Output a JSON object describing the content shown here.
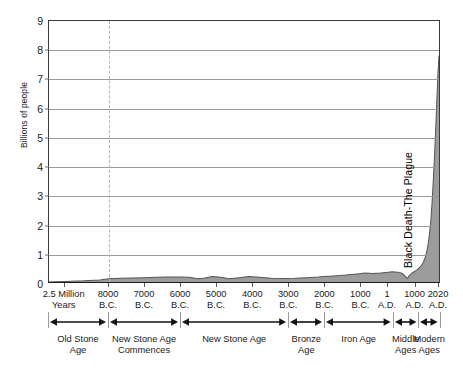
{
  "chart_data": {
    "type": "area",
    "title": "",
    "xlabel": "",
    "ylabel": "Billions of people",
    "ylim": [
      0,
      9
    ],
    "yticks": [
      0,
      1,
      2,
      3,
      4,
      5,
      6,
      7,
      8,
      9
    ],
    "ytick_labels": [
      "0",
      "1",
      "2",
      "3",
      "4",
      "5",
      "6",
      "7",
      "8",
      "9"
    ],
    "grid": true,
    "legend": "none",
    "xtick_labels": [
      "2.5 Million Years",
      "8000 B.C.",
      "7000 B.C.",
      "6000 B.C.",
      "5000 B.C.",
      "4000 B.C.",
      "3000 B.C.",
      "2000 B.C.",
      "1000 B.C.",
      "1 A.D.",
      "1000 A.D.",
      "2020 A.D."
    ],
    "xticks": [
      {
        "line1": "2.5 Million",
        "line2": "Years",
        "pos": 0.04
      },
      {
        "line1": "8000",
        "line2": "B.C.",
        "pos": 0.153
      },
      {
        "line1": "7000",
        "line2": "B.C.",
        "pos": 0.245
      },
      {
        "line1": "6000",
        "line2": "B.C.",
        "pos": 0.337
      },
      {
        "line1": "5000",
        "line2": "B.C.",
        "pos": 0.429
      },
      {
        "line1": "4000",
        "line2": "B.C.",
        "pos": 0.521
      },
      {
        "line1": "3000",
        "line2": "B.C.",
        "pos": 0.613
      },
      {
        "line1": "2000",
        "line2": "B.C.",
        "pos": 0.705
      },
      {
        "line1": "1000",
        "line2": "B.C.",
        "pos": 0.797
      },
      {
        "line1": "1",
        "line2": "A.D.",
        "pos": 0.865
      },
      {
        "line1": "1000",
        "line2": "A.D.",
        "pos": 0.935
      },
      {
        "line1": "2020",
        "line2": "A.D.",
        "pos": 0.995
      }
    ],
    "series": [
      {
        "name": "World population",
        "fill_color": "#9c9c9c",
        "line_color": "#555555",
        "points": [
          {
            "x": 0.0,
            "y": 0.0
          },
          {
            "x": 0.04,
            "y": 0.02
          },
          {
            "x": 0.09,
            "y": 0.04
          },
          {
            "x": 0.13,
            "y": 0.07
          },
          {
            "x": 0.153,
            "y": 0.11
          },
          {
            "x": 0.185,
            "y": 0.13
          },
          {
            "x": 0.215,
            "y": 0.14
          },
          {
            "x": 0.245,
            "y": 0.15
          },
          {
            "x": 0.275,
            "y": 0.16
          },
          {
            "x": 0.305,
            "y": 0.17
          },
          {
            "x": 0.337,
            "y": 0.17
          },
          {
            "x": 0.36,
            "y": 0.16
          },
          {
            "x": 0.382,
            "y": 0.11
          },
          {
            "x": 0.4,
            "y": 0.14
          },
          {
            "x": 0.418,
            "y": 0.19
          },
          {
            "x": 0.44,
            "y": 0.16
          },
          {
            "x": 0.462,
            "y": 0.11
          },
          {
            "x": 0.488,
            "y": 0.15
          },
          {
            "x": 0.512,
            "y": 0.19
          },
          {
            "x": 0.54,
            "y": 0.16
          },
          {
            "x": 0.57,
            "y": 0.13
          },
          {
            "x": 0.6,
            "y": 0.12
          },
          {
            "x": 0.63,
            "y": 0.13
          },
          {
            "x": 0.66,
            "y": 0.15
          },
          {
            "x": 0.69,
            "y": 0.17
          },
          {
            "x": 0.705,
            "y": 0.19
          },
          {
            "x": 0.73,
            "y": 0.21
          },
          {
            "x": 0.76,
            "y": 0.24
          },
          {
            "x": 0.79,
            "y": 0.28
          },
          {
            "x": 0.81,
            "y": 0.31
          },
          {
            "x": 0.83,
            "y": 0.29
          },
          {
            "x": 0.85,
            "y": 0.31
          },
          {
            "x": 0.865,
            "y": 0.33
          },
          {
            "x": 0.88,
            "y": 0.35
          },
          {
            "x": 0.895,
            "y": 0.34
          },
          {
            "x": 0.905,
            "y": 0.3
          },
          {
            "x": 0.912,
            "y": 0.22
          },
          {
            "x": 0.918,
            "y": 0.12
          },
          {
            "x": 0.924,
            "y": 0.22
          },
          {
            "x": 0.932,
            "y": 0.32
          },
          {
            "x": 0.942,
            "y": 0.4
          },
          {
            "x": 0.952,
            "y": 0.52
          },
          {
            "x": 0.96,
            "y": 0.68
          },
          {
            "x": 0.966,
            "y": 0.9
          },
          {
            "x": 0.971,
            "y": 1.2
          },
          {
            "x": 0.975,
            "y": 1.6
          },
          {
            "x": 0.979,
            "y": 2.1
          },
          {
            "x": 0.982,
            "y": 2.7
          },
          {
            "x": 0.985,
            "y": 3.4
          },
          {
            "x": 0.988,
            "y": 4.2
          },
          {
            "x": 0.991,
            "y": 5.1
          },
          {
            "x": 0.994,
            "y": 6.1
          },
          {
            "x": 0.997,
            "y": 7.1
          },
          {
            "x": 1.0,
            "y": 7.8
          }
        ]
      }
    ],
    "annotations": [
      {
        "text": "Black Death-The Plague",
        "x": 0.918,
        "orientation": "vertical"
      }
    ],
    "reference_lines": [
      {
        "x": 0.153,
        "style": "dashed",
        "color": "#b4b4b4"
      }
    ],
    "eras": [
      {
        "label_line1": "Old Stone",
        "label_line2": "Age",
        "start": 0.0,
        "end": 0.153
      },
      {
        "label_line1": "New Stone Age",
        "label_line2": "Commences",
        "start": 0.153,
        "end": 0.337
      },
      {
        "label_line1": "New Stone Age",
        "label_line2": "",
        "start": 0.337,
        "end": 0.613
      },
      {
        "label_line1": "Bronze",
        "label_line2": "Age",
        "start": 0.613,
        "end": 0.705
      },
      {
        "label_line1": "Iron Age",
        "label_line2": "",
        "start": 0.705,
        "end": 0.88
      },
      {
        "label_line1": "Middle",
        "label_line2": "Ages",
        "start": 0.88,
        "end": 0.945
      },
      {
        "label_line1": "Modern",
        "label_line2": "Ages",
        "start": 0.945,
        "end": 1.0
      }
    ]
  }
}
